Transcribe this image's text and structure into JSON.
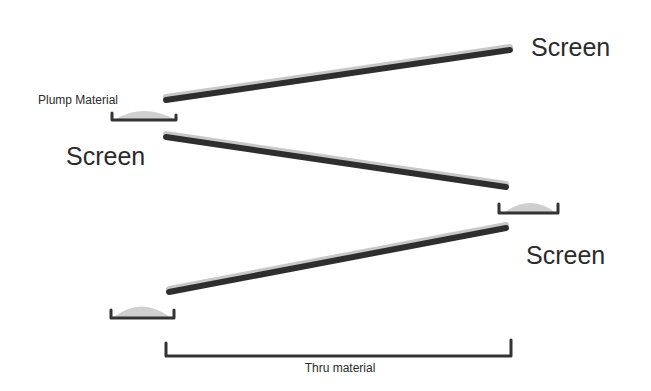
{
  "diagram": {
    "labels": {
      "plump_material": "Plump Material",
      "screen_left": "Screen",
      "screen_top_right": "Screen",
      "screen_bottom_right": "Screen",
      "thru_material": "Thru material"
    },
    "colors": {
      "screen_line": "#2e2e2e",
      "screen_highlight": "#c8c8c8",
      "bracket": "#333333",
      "material": "#cfcfcf",
      "text": "#2b2b2b",
      "background": "#ffffff"
    },
    "screens": [
      {
        "name": "top-screen",
        "from": [
          166,
          100
        ],
        "to": [
          510,
          50
        ]
      },
      {
        "name": "middle-screen",
        "from": [
          166,
          137
        ],
        "to": [
          506,
          187
        ]
      },
      {
        "name": "bottom-screen",
        "from": [
          169,
          292
        ],
        "to": [
          506,
          228
        ]
      }
    ],
    "trays": [
      {
        "name": "tray-top-left",
        "x1": 111,
        "x2": 177,
        "y": 121
      },
      {
        "name": "tray-middle-right",
        "x1": 498,
        "x2": 558,
        "y": 213
      },
      {
        "name": "tray-bottom-left",
        "x1": 110,
        "x2": 174,
        "y": 319
      }
    ]
  }
}
